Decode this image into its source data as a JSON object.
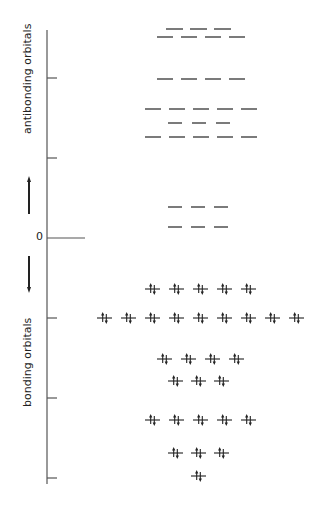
{
  "diagram": {
    "type": "molecular-orbital-energy-level-diagram",
    "axis": {
      "x": 47,
      "y_top": 30,
      "y_bottom": 484,
      "zero_label": "0",
      "zero_y": 238,
      "zero_line_end_x": 85,
      "ticks_y": [
        78,
        158,
        318,
        398,
        478
      ],
      "tick_length": 10,
      "color": "#555555"
    },
    "labels": {
      "antibonding": "antibonding orbitals",
      "bonding": "bonding orbitals"
    },
    "arrows": {
      "up": {
        "x": 29,
        "y_tail": 214,
        "y_head": 176
      },
      "down": {
        "x": 29,
        "y_tail": 256,
        "y_head": 293
      }
    },
    "colors": {
      "level": "#333333",
      "electron": "#222222",
      "text": "#222222"
    },
    "antibonding_levels": [
      {
        "y": 29,
        "count": 3,
        "x_start": 166,
        "spacing": 24,
        "width": 17
      },
      {
        "y": 37,
        "count": 4,
        "x_start": 157,
        "spacing": 24,
        "width": 16
      },
      {
        "y": 79,
        "count": 4,
        "x_start": 157,
        "spacing": 24,
        "width": 16
      },
      {
        "y": 109,
        "count": 5,
        "x_start": 145,
        "spacing": 24,
        "width": 16
      },
      {
        "y": 123,
        "count": 3,
        "x_start": 168,
        "spacing": 24,
        "width": 14
      },
      {
        "y": 137,
        "count": 5,
        "x_start": 145,
        "spacing": 24,
        "width": 16
      },
      {
        "y": 207,
        "count": 3,
        "x_start": 168,
        "spacing": 23,
        "width": 14
      },
      {
        "y": 227,
        "count": 3,
        "x_start": 168,
        "spacing": 23,
        "width": 14
      }
    ],
    "bonding_levels": [
      {
        "y": 289,
        "count": 5,
        "x_start": 145,
        "spacing": 24,
        "width": 15,
        "electrons": "↑↓"
      },
      {
        "y": 318,
        "count": 9,
        "x_start": 97,
        "spacing": 24,
        "width": 15,
        "electrons": "↑↓"
      },
      {
        "y": 359,
        "count": 4,
        "x_start": 157,
        "spacing": 24,
        "width": 15,
        "electrons": "↑↓"
      },
      {
        "y": 381,
        "count": 3,
        "x_start": 168,
        "spacing": 23,
        "width": 15,
        "electrons": "↑↓"
      },
      {
        "y": 420,
        "count": 5,
        "x_start": 145,
        "spacing": 24,
        "width": 15,
        "electrons": "↑↓"
      },
      {
        "y": 453,
        "count": 3,
        "x_start": 168,
        "spacing": 23,
        "width": 15,
        "electrons": "↑↓"
      },
      {
        "y": 476,
        "count": 1,
        "x_start": 191,
        "spacing": 23,
        "width": 15,
        "electrons": "↑↓"
      }
    ]
  }
}
